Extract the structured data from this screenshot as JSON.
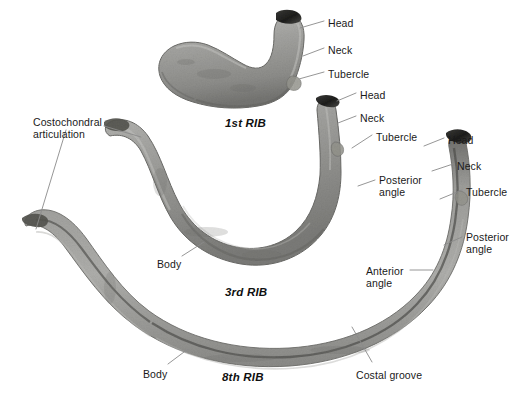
{
  "figure": {
    "background_color": "#ffffff",
    "bone_color": "#9a9a98",
    "bone_shadow_color": "#6f6f6d",
    "bone_highlight_color": "#c2c2bf",
    "articular_dark_color": "#2a2a28",
    "leader_line_color": "#8a8a8a",
    "text_color": "#1a1a1a"
  },
  "titles": [
    {
      "id": "rib1",
      "text": "1st RIB",
      "x": 225,
      "y": 117
    },
    {
      "id": "rib3",
      "text": "3rd RIB",
      "x": 225,
      "y": 286
    },
    {
      "id": "rib8",
      "text": "8th RIB",
      "x": 222,
      "y": 371
    }
  ],
  "labels": [
    {
      "id": "rib1-head",
      "text": "Head",
      "x": 328,
      "y": 17,
      "align": "left"
    },
    {
      "id": "rib1-neck",
      "text": "Neck",
      "x": 328,
      "y": 44,
      "align": "left"
    },
    {
      "id": "rib1-tubercle",
      "text": "Tubercle",
      "x": 328,
      "y": 68,
      "align": "left"
    },
    {
      "id": "rib3-head",
      "text": "Head",
      "x": 360,
      "y": 89,
      "align": "left"
    },
    {
      "id": "rib3-neck",
      "text": "Neck",
      "x": 360,
      "y": 112,
      "align": "left"
    },
    {
      "id": "rib3-tubercle",
      "text": "Tubercle",
      "x": 376,
      "y": 131,
      "align": "left"
    },
    {
      "id": "rib3-posterior",
      "text": "Posterior\nangle",
      "x": 379,
      "y": 174,
      "align": "left"
    },
    {
      "id": "rib3-body",
      "text": "Body",
      "x": 157,
      "y": 258,
      "align": "left"
    },
    {
      "id": "rib8-head",
      "text": "Head",
      "x": 448,
      "y": 134,
      "align": "left"
    },
    {
      "id": "rib8-neck",
      "text": "Neck",
      "x": 457,
      "y": 160,
      "align": "left"
    },
    {
      "id": "rib8-tubercle",
      "text": "Tubercle",
      "x": 466,
      "y": 186,
      "align": "left"
    },
    {
      "id": "rib8-posterior",
      "text": "Posterior\nangle",
      "x": 466,
      "y": 231,
      "align": "left"
    },
    {
      "id": "rib8-anterior",
      "text": "Anterior\nangle",
      "x": 366,
      "y": 265,
      "align": "left"
    },
    {
      "id": "rib8-body",
      "text": "Body",
      "x": 143,
      "y": 368,
      "align": "left"
    },
    {
      "id": "rib8-costalgroove",
      "text": "Costal groove",
      "x": 356,
      "y": 369,
      "align": "left"
    },
    {
      "id": "costochondral",
      "text": "Costochondral\narticulation",
      "x": 33,
      "y": 116,
      "align": "left"
    }
  ],
  "leaders": [
    {
      "id": "leader-rib1-head",
      "from": [
        324,
        21
      ],
      "to": [
        300,
        28
      ]
    },
    {
      "id": "leader-rib1-neck",
      "from": [
        324,
        48
      ],
      "to": [
        303,
        56
      ]
    },
    {
      "id": "leader-rib1-tubercle",
      "from": [
        324,
        72
      ],
      "to": [
        299,
        79
      ]
    },
    {
      "id": "leader-rib3-head",
      "from": [
        356,
        93
      ],
      "to": [
        337,
        101
      ]
    },
    {
      "id": "leader-rib3-neck",
      "from": [
        356,
        116
      ],
      "to": [
        338,
        123
      ]
    },
    {
      "id": "leader-rib3-tubercle",
      "from": [
        372,
        135
      ],
      "to": [
        352,
        148
      ]
    },
    {
      "id": "leader-rib3-posterior",
      "from": [
        375,
        180
      ],
      "to": [
        358,
        186
      ]
    },
    {
      "id": "leader-rib3-body",
      "from": [
        182,
        256
      ],
      "to": [
        204,
        242
      ]
    },
    {
      "id": "leader-rib8-head",
      "from": [
        444,
        138
      ],
      "to": [
        424,
        146
      ]
    },
    {
      "id": "leader-rib8-neck",
      "from": [
        453,
        164
      ],
      "to": [
        432,
        171
      ]
    },
    {
      "id": "leader-rib8-tubercle",
      "from": [
        462,
        190
      ],
      "to": [
        440,
        199
      ]
    },
    {
      "id": "leader-rib8-posterior",
      "from": [
        462,
        237
      ],
      "to": [
        444,
        245
      ]
    },
    {
      "id": "leader-rib8-anterior",
      "from": [
        410,
        270
      ],
      "to": [
        433,
        270
      ]
    },
    {
      "id": "leader-rib8-body",
      "from": [
        168,
        364
      ],
      "to": [
        188,
        349
      ]
    },
    {
      "id": "leader-rib8-costalgroove",
      "from": [
        372,
        362
      ],
      "to": [
        352,
        327
      ]
    },
    {
      "id": "leader-costo-a",
      "from": [
        104,
        126
      ],
      "to": [
        141,
        137
      ]
    },
    {
      "id": "leader-costo-b",
      "from": [
        66,
        130
      ],
      "to": [
        36,
        229
      ]
    }
  ],
  "bones": [
    {
      "id": "rib1",
      "name": "1st rib",
      "description": "broad flat C-shaped bone opening to the right"
    },
    {
      "id": "rib3",
      "name": "3rd rib",
      "description": "U-shaped curved rib"
    },
    {
      "id": "rib8",
      "name": "8th rib",
      "description": "long slender arched rib with costal groove"
    }
  ]
}
